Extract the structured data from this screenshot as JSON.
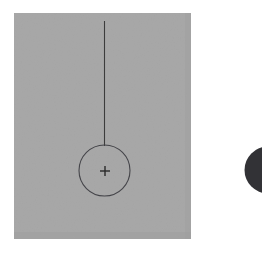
{
  "figure": {
    "canvas": {
      "width": 262,
      "height": 254,
      "background_color": "#ffffff"
    },
    "panel": {
      "label": "gray background plate",
      "x": 14,
      "y": 13,
      "width": 177,
      "height": 226,
      "fill_color": "#a8a8a8",
      "texture": "fine grain noise"
    },
    "pendulum": {
      "label": "pendulum assembly",
      "string": {
        "label": "suspension line",
        "x": 104.5,
        "y_top": 21,
        "y_bottom": 146,
        "stroke_color": "#3c3c3c",
        "stroke_width": 1.1
      },
      "bob": {
        "label": "bob circle outline",
        "cx": 104.5,
        "cy": 170.5,
        "r": 25.5,
        "fill": "none",
        "stroke_color": "#45454a",
        "stroke_width": 1.1
      },
      "center_mark": {
        "label": "center crosshair",
        "cx": 105,
        "cy": 171,
        "arm_length": 5,
        "stroke_color": "#2a2a2a",
        "stroke_width": 1.4,
        "glyph": "+"
      }
    },
    "dark_disc": {
      "label": "dark disc clipped at right edge",
      "cx": 268,
      "cy": 170,
      "r": 23.5,
      "fill_color": "#323236",
      "clipped_edge": "right"
    }
  }
}
